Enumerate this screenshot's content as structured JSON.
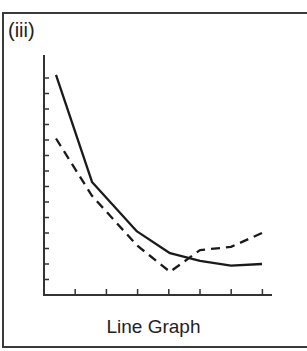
{
  "panel_label": "(iii)",
  "caption": "Line Graph",
  "chart_data": {
    "type": "line",
    "title": "",
    "xlabel": "",
    "ylabel": "",
    "x": [
      0,
      1,
      2,
      3,
      4,
      5,
      6
    ],
    "series": [
      {
        "name": "solid",
        "style": "solid",
        "values": [
          14.2,
          7.3,
          4.1,
          2.7,
          2.2,
          1.9,
          2.0
        ]
      },
      {
        "name": "dashed",
        "style": "dashed",
        "values": [
          10.1,
          6.4,
          3.2,
          1.5,
          2.9,
          3.1,
          4.0
        ]
      }
    ],
    "x_ticks": 7,
    "y_ticks": 14,
    "ylim": [
      0,
      15
    ],
    "grid": false,
    "legend": false,
    "tick_labels": false
  },
  "colors": {
    "line": "#1a1a1a",
    "axis": "#333333",
    "frame": "#3a3a3a"
  }
}
